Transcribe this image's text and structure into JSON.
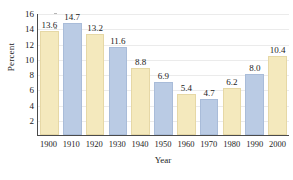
{
  "chart_data": {
    "type": "bar",
    "title": "",
    "xlabel": "Year",
    "ylabel": "Percent",
    "categories": [
      "1900",
      "1910",
      "1920",
      "1930",
      "1940",
      "1950",
      "1960",
      "1970",
      "1980",
      "1990",
      "2000"
    ],
    "values": [
      13.6,
      14.7,
      13.2,
      11.6,
      8.8,
      6.9,
      5.4,
      4.7,
      6.2,
      8.0,
      10.4
    ],
    "value_labels": [
      "13.6",
      "14.7",
      "13.2",
      "11.6",
      "8.8",
      "6.9",
      "5.4",
      "4.7",
      "6.2",
      "8.0",
      "10.4"
    ],
    "bar_colors": [
      "yellow",
      "blue",
      "yellow",
      "blue",
      "yellow",
      "blue",
      "yellow",
      "blue",
      "yellow",
      "blue",
      "yellow"
    ],
    "ylim": [
      0,
      16
    ],
    "ytick_values": [
      2,
      4,
      6,
      8,
      10,
      12,
      14,
      16
    ],
    "ytick_labels": [
      "2",
      "4",
      "6",
      "8",
      "10",
      "12",
      "14",
      "16"
    ],
    "grid": true,
    "legend": "none",
    "colors": {
      "yellow": "#f4e9bd",
      "blue": "#bacbe4",
      "axis": "#4a4a4a",
      "grid": "#ebebeb",
      "text": "#1c1c1c"
    }
  }
}
